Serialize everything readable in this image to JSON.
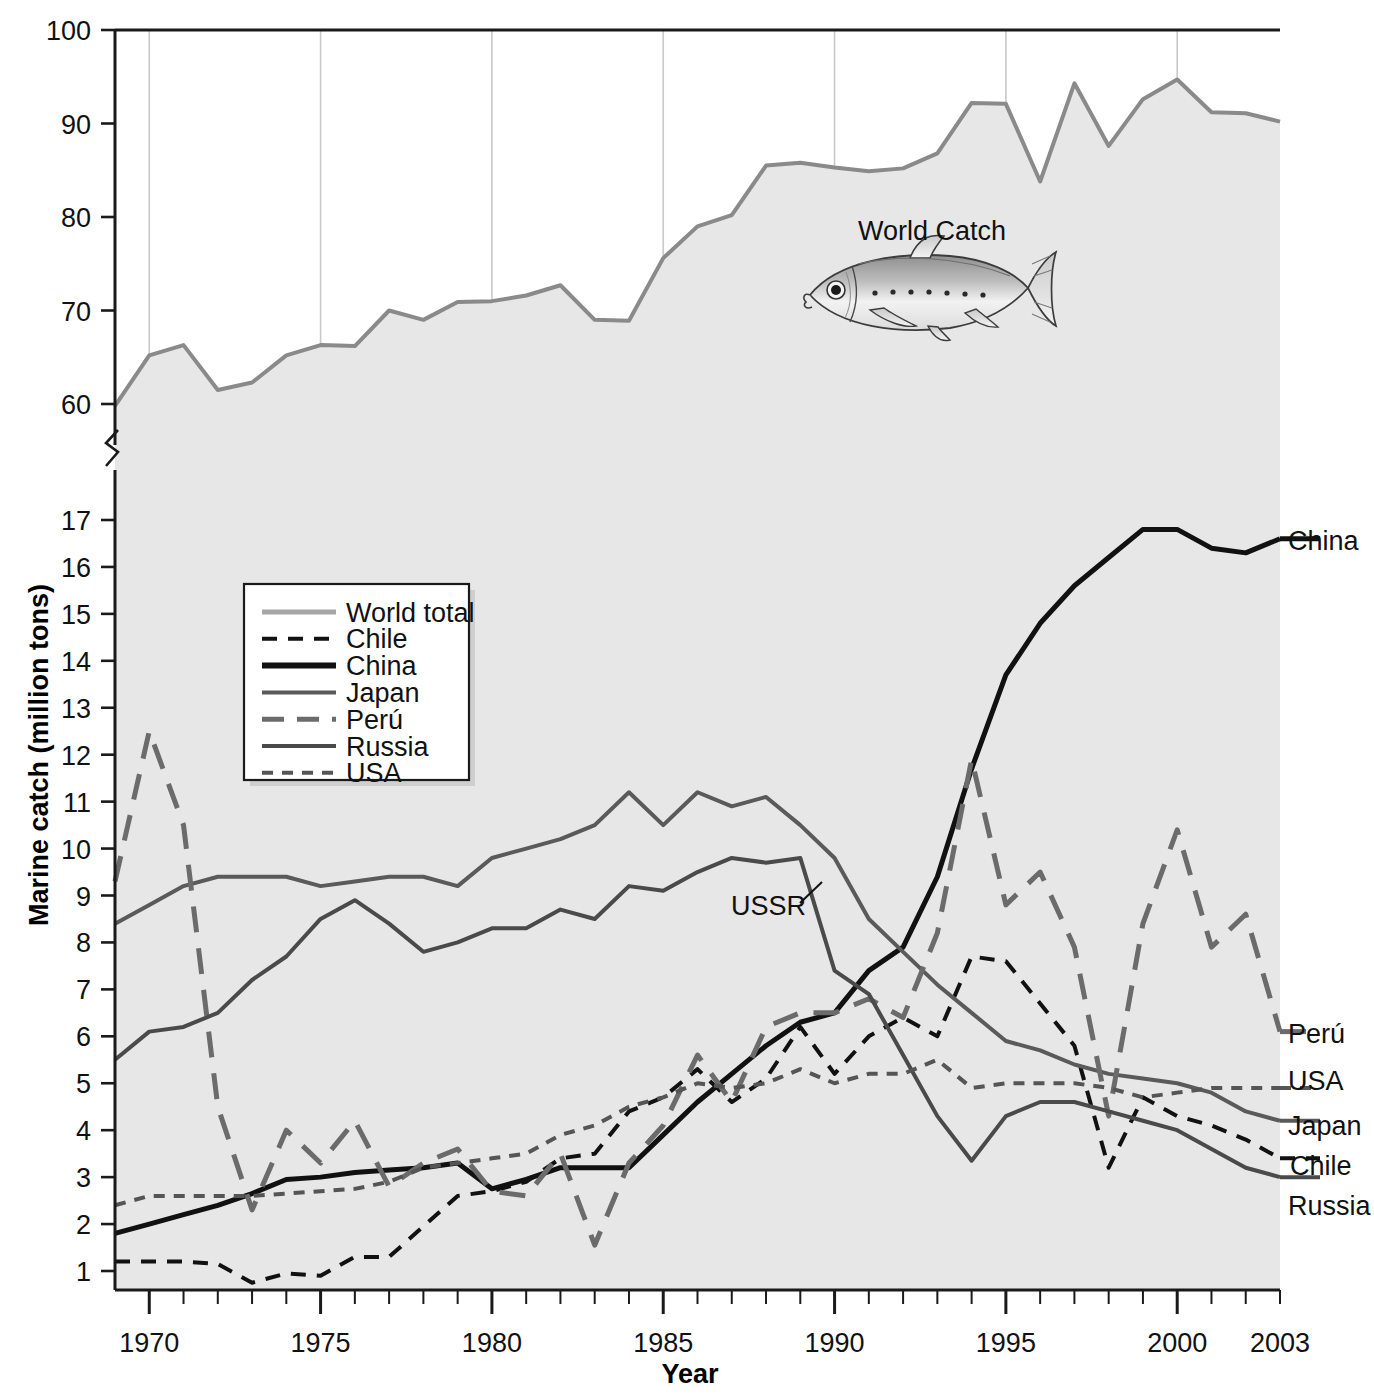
{
  "chart_data": {
    "type": "line",
    "title": "",
    "xlabel": "Year",
    "ylabel": "Marine catch (million tons)",
    "x": [
      1969,
      1970,
      1971,
      1972,
      1973,
      1974,
      1975,
      1976,
      1977,
      1978,
      1979,
      1980,
      1981,
      1982,
      1983,
      1984,
      1985,
      1986,
      1987,
      1988,
      1989,
      1990,
      1991,
      1992,
      1993,
      1994,
      1995,
      1996,
      1997,
      1998,
      1999,
      2000,
      2001,
      2002,
      2003
    ],
    "xlim": [
      1969,
      2003
    ],
    "xticks_labeled": [
      1970,
      1975,
      1980,
      1985,
      1990,
      1995,
      2000,
      2003
    ],
    "gridlines_x": [
      1970,
      1975,
      1980,
      1985,
      1990,
      1995,
      2000
    ],
    "axis_break": true,
    "upper_axis": {
      "ylim": [
        57,
        100
      ],
      "ticks": [
        60,
        70,
        80,
        90,
        100
      ]
    },
    "lower_axis": {
      "ylim": [
        0.5,
        17.8
      ],
      "ticks": [
        1,
        2,
        3,
        4,
        5,
        6,
        7,
        8,
        9,
        10,
        11,
        12,
        13,
        14,
        15,
        16,
        17
      ]
    },
    "grid": "vertical-only",
    "legend_position": "upper-left-inside",
    "series": [
      {
        "name": "World total",
        "style": "solid",
        "color": "#8a8a8a",
        "width": 4,
        "filled": true,
        "axis": "upper",
        "values": [
          59.8,
          65.2,
          66.3,
          61.5,
          62.3,
          65.2,
          66.3,
          66.2,
          70.0,
          69.0,
          70.9,
          71.0,
          71.6,
          72.7,
          69.0,
          68.9,
          75.6,
          79.0,
          80.2,
          85.5,
          85.8,
          85.3,
          84.9,
          85.2,
          86.8,
          92.2,
          92.1,
          83.8,
          94.3,
          87.6,
          92.6,
          94.7,
          91.2,
          91.1,
          90.2
        ]
      },
      {
        "name": "Chile",
        "style": "dashed-short-thick",
        "color": "#111111",
        "width": 4,
        "axis": "lower",
        "values": [
          1.2,
          1.2,
          1.2,
          1.15,
          0.75,
          0.95,
          0.9,
          1.3,
          1.3,
          1.95,
          2.6,
          2.7,
          2.9,
          3.4,
          3.5,
          4.4,
          4.7,
          5.3,
          4.6,
          5.1,
          6.2,
          5.2,
          6.0,
          6.4,
          6.0,
          7.7,
          7.6,
          6.7,
          5.8,
          3.2,
          4.7,
          4.3,
          4.1,
          3.8,
          3.4
        ]
      },
      {
        "name": "China",
        "style": "solid",
        "color": "#111111",
        "width": 5,
        "axis": "lower",
        "values": [
          1.8,
          2.0,
          2.2,
          2.4,
          2.65,
          2.95,
          3.0,
          3.1,
          3.15,
          3.2,
          3.3,
          2.75,
          2.95,
          3.2,
          3.2,
          3.2,
          3.9,
          4.6,
          5.2,
          5.8,
          6.3,
          6.5,
          7.4,
          7.9,
          9.4,
          11.7,
          13.7,
          14.8,
          15.6,
          16.2,
          16.8,
          16.8,
          16.4,
          16.3,
          16.6
        ]
      },
      {
        "name": "Japan",
        "style": "solid",
        "color": "#5a5a5a",
        "width": 4,
        "axis": "lower",
        "values": [
          8.4,
          8.8,
          9.2,
          9.4,
          9.4,
          9.4,
          9.2,
          9.3,
          9.4,
          9.4,
          9.2,
          9.8,
          10.0,
          10.2,
          10.5,
          11.2,
          10.5,
          11.2,
          10.9,
          11.1,
          10.5,
          9.8,
          8.5,
          7.8,
          7.1,
          6.5,
          5.9,
          5.7,
          5.4,
          5.2,
          5.1,
          5.0,
          4.8,
          4.4,
          4.2
        ]
      },
      {
        "name": "Perú",
        "style": "dashed-long",
        "color": "#6b6b6b",
        "width": 5,
        "axis": "lower",
        "values": [
          9.3,
          12.5,
          10.5,
          4.5,
          2.3,
          4.0,
          3.3,
          4.2,
          2.8,
          3.3,
          3.6,
          2.7,
          2.6,
          3.5,
          1.55,
          3.3,
          4.1,
          5.6,
          4.6,
          6.2,
          6.5,
          6.5,
          6.8,
          6.4,
          8.2,
          11.9,
          8.8,
          9.5,
          7.9,
          4.3,
          8.4,
          10.4,
          7.9,
          8.6,
          6.1
        ]
      },
      {
        "name": "Russia",
        "style": "solid",
        "color": "#4a4a4a",
        "width": 4,
        "axis": "lower",
        "values": [
          5.5,
          6.1,
          6.2,
          6.5,
          7.2,
          7.7,
          8.5,
          8.9,
          8.4,
          7.8,
          8.0,
          8.3,
          8.3,
          8.7,
          8.5,
          9.2,
          9.1,
          9.5,
          9.8,
          9.7,
          9.8,
          7.4,
          6.9,
          5.6,
          4.3,
          3.35,
          4.3,
          4.6,
          4.6,
          4.4,
          4.2,
          4.0,
          3.6,
          3.2,
          3.0
        ]
      },
      {
        "name": "USA",
        "style": "dashed-short",
        "color": "#555555",
        "width": 4,
        "axis": "lower",
        "values": [
          2.4,
          2.6,
          2.6,
          2.6,
          2.6,
          2.65,
          2.7,
          2.75,
          2.9,
          3.2,
          3.3,
          3.4,
          3.5,
          3.9,
          4.1,
          4.5,
          4.7,
          5.0,
          4.9,
          5.0,
          5.3,
          5.0,
          5.2,
          5.2,
          5.5,
          4.9,
          5.0,
          5.0,
          5.0,
          4.9,
          4.7,
          4.8,
          4.9,
          4.9,
          4.9
        ]
      }
    ],
    "annotations": [
      {
        "id": "world-catch",
        "text": "World Catch",
        "x": 1990,
        "y_upper": 78
      },
      {
        "id": "ussr",
        "text": "USSR",
        "x": 1988,
        "y_lower": 8.9
      }
    ],
    "end_labels": [
      {
        "name": "China",
        "value": 16.6
      },
      {
        "name": "Perú",
        "value": 6.1
      },
      {
        "name": "USA",
        "value": 4.9
      },
      {
        "name": "Japan",
        "value": 4.2
      },
      {
        "name": "Chile",
        "value": 3.4
      },
      {
        "name": "Russia",
        "value": 3.0
      }
    ]
  },
  "axis": {
    "ylabel": "Marine catch (million tons)",
    "xlabel": "Year",
    "upper_ticks": [
      "100",
      "90",
      "80",
      "70",
      "60"
    ],
    "lower_ticks": [
      "17",
      "16",
      "15",
      "14",
      "13",
      "12",
      "11",
      "10",
      "9",
      "8",
      "7",
      "6",
      "5",
      "4",
      "3",
      "2",
      "1"
    ],
    "x_ticks": [
      "1970",
      "1975",
      "1980",
      "1985",
      "1990",
      "1995",
      "2000",
      "2003"
    ]
  },
  "legend": {
    "items": [
      {
        "label": "World total",
        "icon": "line-solid-light"
      },
      {
        "label": "Chile",
        "icon": "line-dashed-black"
      },
      {
        "label": "China",
        "icon": "line-solid-black"
      },
      {
        "label": "Japan",
        "icon": "line-solid-gray"
      },
      {
        "label": "Perú",
        "icon": "line-longdash-gray"
      },
      {
        "label": "Russia",
        "icon": "line-solid-gray"
      },
      {
        "label": "USA",
        "icon": "line-shortdash-gray"
      }
    ]
  },
  "annotations": {
    "world_catch": "World Catch",
    "ussr": "USSR"
  },
  "end_labels": {
    "china": "China",
    "peru": "Perú",
    "usa": "USA",
    "japan": "Japan",
    "chile": "Chile",
    "russia": "Russia"
  },
  "colors": {
    "world_total": "#8a8a8a",
    "world_fill": "#e7e7e7",
    "china": "#111111",
    "chile": "#111111",
    "japan": "#5a5a5a",
    "peru": "#6b6b6b",
    "russia": "#4a4a4a",
    "usa": "#555555",
    "gridline": "#c9c9c9",
    "axis": "#1a1a1a"
  }
}
